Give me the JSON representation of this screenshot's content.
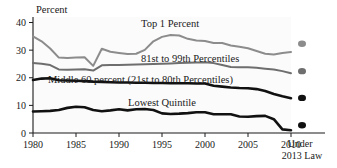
{
  "chart_data": {
    "type": "line",
    "title": "",
    "subtitle": "",
    "xlabel": "",
    "ylabel": "Percent",
    "xlim": [
      1980,
      2010
    ],
    "ylim": [
      0,
      42
    ],
    "yticks": [
      0,
      10,
      20,
      30,
      40
    ],
    "ytick_labels": [
      "0",
      "10",
      "20",
      "30",
      "40"
    ],
    "xticks": [
      1980,
      1985,
      1990,
      1995,
      2000,
      2005,
      2010
    ],
    "xtick_labels": [
      "1980",
      "1985",
      "1990",
      "1995",
      "2000",
      "2005",
      "2010"
    ],
    "grid": false,
    "legend_position": "inline-annotations",
    "x": [
      1980,
      1981,
      1982,
      1983,
      1984,
      1985,
      1986,
      1987,
      1988,
      1989,
      1990,
      1991,
      1992,
      1993,
      1994,
      1995,
      1996,
      1997,
      1998,
      1999,
      2000,
      2001,
      2002,
      2003,
      2004,
      2005,
      2006,
      2007,
      2008,
      2009,
      2010
    ],
    "series": [
      {
        "name": "Top 1 Percent",
        "color": "#8c8c8c",
        "label": "Top 1 Percent",
        "values": [
          35.0,
          33.2,
          30.6,
          27.3,
          27.2,
          27.3,
          27.4,
          24.3,
          30.5,
          29.4,
          29.0,
          28.6,
          28.7,
          30.1,
          33.2,
          34.8,
          35.5,
          35.3,
          34.1,
          33.5,
          33.3,
          32.6,
          32.6,
          31.7,
          31.2,
          30.7,
          29.7,
          28.7,
          28.4,
          29.0,
          29.3
        ]
      },
      {
        "name": "81st to 99th Percentiles",
        "color": "#6e6e6e",
        "label": "81st to 99th Percentiles",
        "values": [
          25.3,
          25.1,
          24.6,
          23.0,
          22.9,
          23.0,
          23.1,
          22.6,
          24.5,
          24.6,
          24.6,
          24.7,
          24.8,
          24.9,
          25.0,
          25.1,
          25.2,
          25.3,
          25.4,
          25.5,
          25.6,
          25.3,
          24.6,
          23.9,
          23.8,
          23.8,
          23.6,
          23.3,
          23.0,
          22.4,
          21.6
        ]
      },
      {
        "name": "Middle 60 percent (21st to 80th Percentiles)",
        "color": "#111111",
        "label": "Middle 60 percent (21st to 80th Percentiles)",
        "values": [
          19.2,
          19.7,
          19.8,
          19.1,
          19.0,
          18.9,
          18.8,
          18.6,
          18.5,
          18.4,
          18.3,
          18.3,
          18.2,
          18.2,
          18.1,
          18.1,
          18.0,
          18.0,
          18.0,
          17.9,
          17.9,
          17.1,
          16.8,
          16.5,
          16.3,
          16.2,
          15.9,
          15.2,
          14.1,
          13.3,
          12.6
        ]
      },
      {
        "name": "Lowest Quintile",
        "color": "#111111",
        "label": "Lowest Quintile",
        "values": [
          7.8,
          7.9,
          8.0,
          8.3,
          9.1,
          9.5,
          9.3,
          8.3,
          7.9,
          8.2,
          8.6,
          8.2,
          8.6,
          8.7,
          8.3,
          7.1,
          6.9,
          7.0,
          7.2,
          7.5,
          7.5,
          6.8,
          6.8,
          6.8,
          6.0,
          5.9,
          6.1,
          6.2,
          5.0,
          1.3,
          1.0
        ]
      }
    ],
    "projection_points": [
      {
        "series": "Top 1 Percent",
        "value": 32.3,
        "color": "#8c8c8c"
      },
      {
        "series": "81st to 99th Percentiles",
        "value": 22.4,
        "color": "#6e6e6e"
      },
      {
        "series": "Middle 60 percent (21st to 80th Percentiles)",
        "value": 12.7,
        "color": "#111111"
      },
      {
        "series": "Lowest Quintile",
        "value": 2.8,
        "color": "#111111"
      }
    ],
    "projection_caption_line1": "Under",
    "projection_caption_line2": "2013 Law"
  },
  "axis": {
    "y_axis_title": "Percent"
  }
}
